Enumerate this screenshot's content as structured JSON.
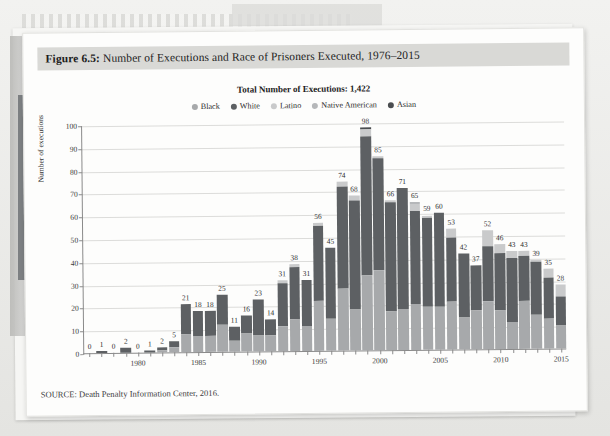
{
  "figure": {
    "label": "Figure 6.5:",
    "caption": "Number of Executions and Race of Prisoners Executed, 1976–2015",
    "source": "SOURCE: Death Penalty Information Center, 2016."
  },
  "chart_data": {
    "type": "bar",
    "subtype": "stacked-vertical",
    "title": "Total Number of Executions: 1,422",
    "xlabel": "",
    "ylabel": "Number of executions",
    "ylim": [
      0,
      100
    ],
    "yticks": [
      0,
      10,
      20,
      30,
      40,
      50,
      60,
      70,
      80,
      90,
      100
    ],
    "grid": true,
    "legend_position": "top-center",
    "xtick_labels": [
      "1980",
      "1985",
      "1990",
      "1995",
      "2000",
      "2005",
      "2010",
      "2015"
    ],
    "categories": [
      "1976",
      "1977",
      "1978",
      "1979",
      "1980",
      "1981",
      "1982",
      "1983",
      "1984",
      "1985",
      "1986",
      "1987",
      "1988",
      "1989",
      "1990",
      "1991",
      "1992",
      "1993",
      "1994",
      "1995",
      "1996",
      "1997",
      "1998",
      "1999",
      "2000",
      "2001",
      "2002",
      "2003",
      "2004",
      "2005",
      "2006",
      "2007",
      "2008",
      "2009",
      "2010",
      "2011",
      "2012",
      "2013",
      "2014",
      "2015"
    ],
    "totals": [
      0,
      1,
      0,
      2,
      0,
      1,
      2,
      5,
      21,
      18,
      18,
      25,
      11,
      16,
      23,
      14,
      31,
      38,
      31,
      56,
      45,
      74,
      68,
      98,
      85,
      66,
      71,
      65,
      59,
      60,
      53,
      42,
      37,
      52,
      46,
      43,
      43,
      39,
      35,
      28
    ],
    "series": [
      {
        "name": "Black",
        "color": "#a7a9ab",
        "values": [
          0,
          0,
          0,
          0,
          0,
          0,
          1,
          2,
          8,
          7,
          7,
          12,
          5,
          8,
          7,
          7,
          11,
          14,
          11,
          22,
          14,
          27,
          18,
          33,
          35,
          17,
          18,
          20,
          19,
          19,
          21,
          14,
          17,
          21,
          17,
          12,
          21,
          15,
          13,
          10
        ]
      },
      {
        "name": "White",
        "color": "#5d6063",
        "values": [
          0,
          1,
          0,
          2,
          0,
          1,
          1,
          3,
          13,
          11,
          11,
          13,
          6,
          8,
          16,
          7,
          19,
          23,
          20,
          33,
          31,
          45,
          48,
          61,
          49,
          48,
          53,
          41,
          39,
          41,
          28,
          28,
          20,
          24,
          25,
          28,
          20,
          23,
          18,
          13
        ]
      },
      {
        "name": "Latino",
        "color": "#c9cacb",
        "values": [
          0,
          0,
          0,
          0,
          0,
          0,
          0,
          0,
          0,
          0,
          0,
          0,
          0,
          0,
          0,
          0,
          1,
          1,
          0,
          1,
          0,
          2,
          2,
          3,
          1,
          1,
          0,
          3,
          1,
          0,
          4,
          0,
          0,
          7,
          4,
          3,
          2,
          1,
          4,
          5
        ]
      },
      {
        "name": "Native American",
        "color": "#b5b7b9",
        "values": [
          0,
          0,
          0,
          0,
          0,
          0,
          0,
          0,
          0,
          0,
          0,
          0,
          0,
          0,
          0,
          0,
          0,
          0,
          0,
          0,
          0,
          0,
          0,
          0,
          0,
          0,
          0,
          1,
          0,
          0,
          0,
          0,
          0,
          0,
          0,
          0,
          0,
          0,
          0,
          0
        ]
      },
      {
        "name": "Asian",
        "color": "#4a4d50",
        "values": [
          0,
          0,
          0,
          0,
          0,
          0,
          0,
          0,
          0,
          0,
          0,
          0,
          0,
          0,
          0,
          0,
          0,
          0,
          0,
          0,
          0,
          0,
          0,
          1,
          0,
          0,
          0,
          0,
          0,
          0,
          0,
          0,
          0,
          0,
          0,
          0,
          0,
          0,
          0,
          0
        ]
      }
    ]
  }
}
